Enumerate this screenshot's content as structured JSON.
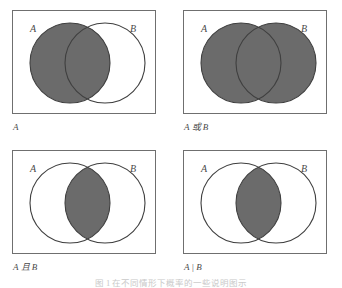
{
  "figure": {
    "caption": "图 1  在不同情形下概率的一些说明图示",
    "set_a_label": "A",
    "set_b_label": "B",
    "fill_color": "#6b6b6b",
    "outline_color": "#3f3f3f",
    "box_color": "#6f6f6f",
    "background_color": "#ffffff"
  },
  "panels": [
    {
      "id": "panel-set-a",
      "caption": "A",
      "shaded_region": "left-circle-only",
      "description": "Set A shaded",
      "a_filled": true,
      "b_filled": false,
      "intersection_filled": true
    },
    {
      "id": "panel-a-or-b",
      "caption": "A 或 B",
      "shaded_region": "union",
      "description": "Union of A and B shaded",
      "a_filled": true,
      "b_filled": true,
      "intersection_filled": true
    },
    {
      "id": "panel-a-and-b",
      "caption": "A 且 B",
      "shaded_region": "intersection",
      "description": "Intersection of A and B shaded",
      "a_filled": false,
      "b_filled": false,
      "intersection_filled": true
    },
    {
      "id": "panel-a-given-b",
      "caption": "A | B",
      "shaded_region": "intersection",
      "description": "Conditional A given B, intersection shaded",
      "a_filled": false,
      "b_filled": false,
      "intersection_filled": true
    }
  ]
}
